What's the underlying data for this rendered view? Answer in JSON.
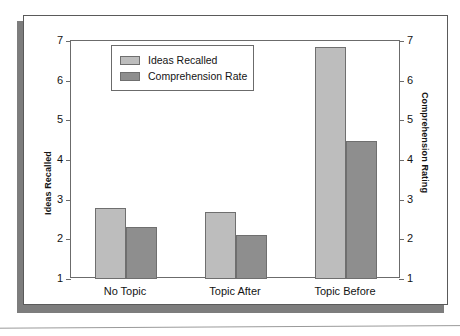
{
  "chart_data": {
    "type": "bar",
    "title": "",
    "categories": [
      "No Topic",
      "Topic After",
      "Topic Before"
    ],
    "series": [
      {
        "name": "Ideas Recalled",
        "axis": "left",
        "color": "#bdbdbd",
        "values": [
          2.79,
          2.68,
          6.85
        ]
      },
      {
        "name": "Comprehension Rate",
        "axis": "right",
        "color": "#8e8e8e",
        "values": [
          2.31,
          2.1,
          4.48
        ]
      }
    ],
    "xlabel": "",
    "ylabel": "Ideas Recalled",
    "y2label": "Comprehension Rating",
    "ylim": [
      1,
      7
    ],
    "y2lim": [
      1,
      7
    ],
    "yticks": [
      1,
      2,
      3,
      4,
      5,
      6,
      7
    ],
    "y2ticks": [
      1,
      2,
      3,
      4,
      5,
      6,
      7
    ],
    "ytick_labels": [
      "1",
      "2",
      "3",
      "4",
      "5",
      "6",
      "7"
    ],
    "y2tick_labels": [
      "1",
      "2",
      "3",
      "4",
      "5",
      "6",
      "7"
    ],
    "grid": false,
    "legend_position": "upper-left-inside"
  },
  "axes": {
    "left_title": "Ideas Recalled",
    "right_title": "Comprehension Rating"
  },
  "legend": {
    "items": [
      {
        "label": "Ideas Recalled"
      },
      {
        "label": "Comprehension Rate"
      }
    ]
  }
}
